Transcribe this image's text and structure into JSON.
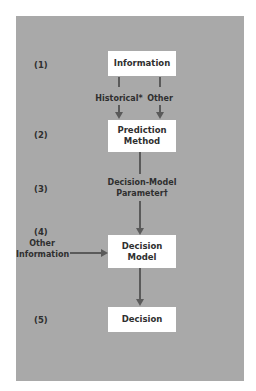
{
  "diagram": {
    "steps": [
      "(1)",
      "(2)",
      "(3)",
      "(4)",
      "(5)"
    ],
    "nodes": {
      "information": "Information",
      "prediction_line1": "Prediction",
      "prediction_line2": "Method",
      "decision_model_line1": "Decision",
      "decision_model_line2": "Model",
      "decision": "Decision"
    },
    "edge_labels": {
      "historical": "Historical*",
      "other": "Other",
      "parameter_line1": "Decision-Model",
      "parameter_line2": "Parameter†",
      "other_info_line1": "Other",
      "other_info_line2": "Information"
    },
    "colors": {
      "panel": "#a9a9a9",
      "box": "#ffffff",
      "arrow": "#5a5a5a",
      "text": "#2f2f2f"
    }
  }
}
